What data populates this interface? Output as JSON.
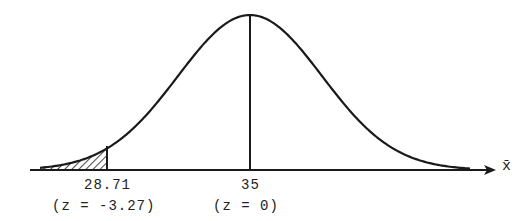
{
  "diagram": {
    "type": "normal-distribution-curve",
    "axis_label": "x̄",
    "mean_label": "35",
    "mean_z_label": "(z = 0)",
    "cutoff_label": "28.71",
    "cutoff_z_label": "(z = -3.27)",
    "shaded_region": "left tail below 28.71",
    "colors": {
      "ink": "#1a1a1a",
      "background": "#ffffff"
    }
  }
}
